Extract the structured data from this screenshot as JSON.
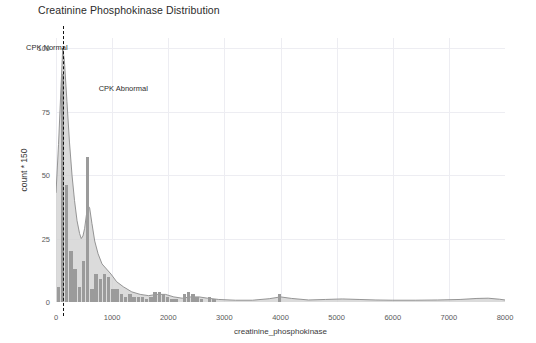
{
  "chart_data": {
    "type": "bar",
    "title": "Creatinine Phosphokinase Distribution",
    "xlabel": "creatinine_phosphokinase",
    "ylabel": "count * 150",
    "xlim": [
      0,
      8000
    ],
    "ylim": [
      0,
      104
    ],
    "xticks": [
      0,
      1000,
      2000,
      3000,
      4000,
      5000,
      6000,
      7000,
      8000
    ],
    "xtick_labels": [
      "0",
      "1000",
      "2000",
      "3000",
      "4000",
      "5000",
      "6000",
      "7000",
      "8000"
    ],
    "yticks": [
      0,
      25,
      50,
      75,
      100
    ],
    "ytick_labels": [
      "0",
      "25",
      "50",
      "75",
      "100"
    ],
    "grid": true,
    "legend": "none",
    "bar_color": "#9b9b9b",
    "density_fill": "#cfcfcf",
    "density_line": "#8a8a8a",
    "bin_width": 75,
    "categories": [
      "0-75",
      "75-150",
      "150-225",
      "225-300",
      "300-375",
      "375-450",
      "450-525",
      "525-600",
      "600-675",
      "675-750",
      "750-825",
      "825-900",
      "900-975",
      "975-1050",
      "1050-1125",
      "1125-1200",
      "1200-1275",
      "1275-1350",
      "1350-1425",
      "1425-1500",
      "1500-1575",
      "1575-1650",
      "1650-1725",
      "1725-1800",
      "1800-1875",
      "1875-1950",
      "1950-2025",
      "2025-2100",
      "2100-2175",
      "2175-2250",
      "2250-2325",
      "2325-2400",
      "2400-2475",
      "2475-2550",
      "2550-2625",
      "2625-2700",
      "2700-2775",
      "2775-2850",
      "3900-3975",
      "3975-4050"
    ],
    "bars": [
      {
        "x": 40,
        "value": 6
      },
      {
        "x": 115,
        "value": 90
      },
      {
        "x": 190,
        "value": 46
      },
      {
        "x": 265,
        "value": 20
      },
      {
        "x": 340,
        "value": 13
      },
      {
        "x": 415,
        "value": 6
      },
      {
        "x": 490,
        "value": 16
      },
      {
        "x": 565,
        "value": 57
      },
      {
        "x": 640,
        "value": 5
      },
      {
        "x": 715,
        "value": 11
      },
      {
        "x": 790,
        "value": 9
      },
      {
        "x": 865,
        "value": 11
      },
      {
        "x": 940,
        "value": 10
      },
      {
        "x": 1015,
        "value": 5
      },
      {
        "x": 1090,
        "value": 5
      },
      {
        "x": 1165,
        "value": 3
      },
      {
        "x": 1240,
        "value": 2
      },
      {
        "x": 1315,
        "value": 3
      },
      {
        "x": 1390,
        "value": 2
      },
      {
        "x": 1465,
        "value": 2
      },
      {
        "x": 1540,
        "value": 2
      },
      {
        "x": 1615,
        "value": 1
      },
      {
        "x": 1690,
        "value": 2
      },
      {
        "x": 1765,
        "value": 4
      },
      {
        "x": 1840,
        "value": 4
      },
      {
        "x": 1915,
        "value": 3
      },
      {
        "x": 1990,
        "value": 2
      },
      {
        "x": 2065,
        "value": 1
      },
      {
        "x": 2140,
        "value": 1
      },
      {
        "x": 2290,
        "value": 3
      },
      {
        "x": 2365,
        "value": 4
      },
      {
        "x": 2440,
        "value": 3
      },
      {
        "x": 2515,
        "value": 2
      },
      {
        "x": 2590,
        "value": 1
      },
      {
        "x": 2740,
        "value": 2
      },
      {
        "x": 2815,
        "value": 1
      },
      {
        "x": 3985,
        "value": 3
      }
    ],
    "density": [
      {
        "x": 0,
        "y": 43
      },
      {
        "x": 45,
        "y": 62
      },
      {
        "x": 90,
        "y": 85
      },
      {
        "x": 120,
        "y": 100
      },
      {
        "x": 150,
        "y": 95
      },
      {
        "x": 195,
        "y": 79
      },
      {
        "x": 240,
        "y": 63
      },
      {
        "x": 285,
        "y": 50
      },
      {
        "x": 330,
        "y": 40
      },
      {
        "x": 375,
        "y": 32
      },
      {
        "x": 420,
        "y": 27
      },
      {
        "x": 450,
        "y": 25
      },
      {
        "x": 480,
        "y": 26
      },
      {
        "x": 510,
        "y": 29
      },
      {
        "x": 540,
        "y": 34
      },
      {
        "x": 570,
        "y": 38
      },
      {
        "x": 600,
        "y": 37
      },
      {
        "x": 640,
        "y": 31
      },
      {
        "x": 690,
        "y": 24
      },
      {
        "x": 750,
        "y": 19
      },
      {
        "x": 820,
        "y": 15
      },
      {
        "x": 900,
        "y": 13
      },
      {
        "x": 980,
        "y": 11
      },
      {
        "x": 1080,
        "y": 8
      },
      {
        "x": 1200,
        "y": 6
      },
      {
        "x": 1350,
        "y": 4
      },
      {
        "x": 1500,
        "y": 3
      },
      {
        "x": 1650,
        "y": 2.5
      },
      {
        "x": 1800,
        "y": 3
      },
      {
        "x": 1950,
        "y": 3
      },
      {
        "x": 2100,
        "y": 2
      },
      {
        "x": 2250,
        "y": 1.5
      },
      {
        "x": 2400,
        "y": 2
      },
      {
        "x": 2550,
        "y": 2
      },
      {
        "x": 2700,
        "y": 1.5
      },
      {
        "x": 2900,
        "y": 1
      },
      {
        "x": 3200,
        "y": 0.7
      },
      {
        "x": 3500,
        "y": 0.7
      },
      {
        "x": 3800,
        "y": 1.3
      },
      {
        "x": 4000,
        "y": 2
      },
      {
        "x": 4200,
        "y": 1.4
      },
      {
        "x": 4500,
        "y": 0.8
      },
      {
        "x": 4800,
        "y": 1
      },
      {
        "x": 5100,
        "y": 1.2
      },
      {
        "x": 5400,
        "y": 1
      },
      {
        "x": 5700,
        "y": 0.8
      },
      {
        "x": 6000,
        "y": 0.7
      },
      {
        "x": 6400,
        "y": 0.7
      },
      {
        "x": 6800,
        "y": 0.8
      },
      {
        "x": 7200,
        "y": 1
      },
      {
        "x": 7500,
        "y": 1.4
      },
      {
        "x": 7700,
        "y": 1.5
      },
      {
        "x": 7900,
        "y": 1.1
      },
      {
        "x": 8000,
        "y": 0.8
      }
    ],
    "annotations": [
      {
        "label": "CPK Normal",
        "x": 120,
        "y": 100,
        "line": true,
        "line_style": "dashed",
        "line_color": "#111111"
      },
      {
        "label": "CPK Abnormal",
        "x": 760,
        "y": 84,
        "line": false
      }
    ]
  }
}
